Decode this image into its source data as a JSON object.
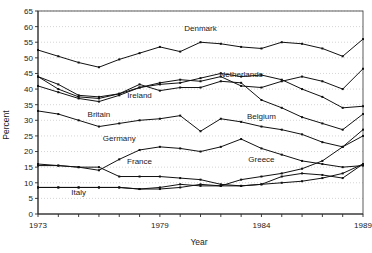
{
  "chart_data": {
    "type": "line",
    "title": "",
    "xlabel": "Year",
    "ylabel": "Percent",
    "xlim": [
      1973,
      1989
    ],
    "ylim": [
      0,
      65
    ],
    "ytick_step": 5,
    "yticks": [
      0,
      5,
      10,
      15,
      20,
      25,
      30,
      35,
      40,
      45,
      50,
      55,
      60,
      65
    ],
    "xticks_labeled": [
      1973,
      1979,
      1984,
      1989
    ],
    "x": [
      1973,
      1974,
      1975,
      1976,
      1977,
      1978,
      1979,
      1980,
      1981,
      1982,
      1983,
      1984,
      1985,
      1986,
      1987,
      1988,
      1989
    ],
    "grid": true,
    "legend_position": "inline-labels",
    "series": [
      {
        "name": "Denmark",
        "label_x": 1981,
        "label_y": 58.5,
        "values": [
          52.5,
          50.5,
          48.5,
          47.0,
          49.5,
          51.5,
          53.5,
          52.0,
          55.0,
          54.5,
          53.5,
          53.0,
          55.0,
          54.5,
          53.0,
          50.5,
          56.0
        ]
      },
      {
        "name": "Netherlands",
        "label_x": 1983,
        "label_y": 44.0,
        "values": [
          44.0,
          41.5,
          38.0,
          37.5,
          38.5,
          40.5,
          42.0,
          43.0,
          42.5,
          44.0,
          41.0,
          40.5,
          42.5,
          44.0,
          42.5,
          40.0,
          46.5
        ]
      },
      {
        "name": "Ireland",
        "label_x": 1978,
        "label_y": 37.0,
        "values": [
          41.0,
          39.0,
          37.0,
          36.0,
          38.0,
          40.5,
          41.5,
          42.0,
          43.5,
          45.0,
          44.0,
          44.5,
          43.0,
          40.0,
          37.5,
          34.0,
          34.5
        ]
      },
      {
        "name": "Britain",
        "label_x": 1976,
        "label_y": 31.0,
        "values": [
          33.0,
          32.0,
          30.0,
          28.0,
          29.0,
          30.0,
          30.5,
          31.5,
          26.5,
          30.5,
          29.5,
          28.0,
          27.0,
          25.5,
          23.0,
          21.5,
          25.0
        ]
      },
      {
        "name": "Belgium",
        "label_x": 1984,
        "label_y": 30.5,
        "values": [
          44.0,
          40.0,
          37.5,
          37.0,
          38.5,
          41.5,
          39.5,
          40.5,
          40.5,
          42.5,
          42.0,
          36.5,
          34.0,
          31.0,
          29.0,
          27.0,
          32.0
        ]
      },
      {
        "name": "Germany",
        "label_x": 1977,
        "label_y": 23.5,
        "values": [
          15.5,
          15.5,
          15.0,
          14.0,
          17.5,
          20.5,
          21.5,
          21.0,
          20.0,
          21.5,
          24.0,
          21.0,
          19.0,
          17.0,
          16.0,
          15.0,
          15.5
        ]
      },
      {
        "name": "France",
        "label_x": 1978,
        "label_y": 16.0,
        "values": [
          16.0,
          15.5,
          15.0,
          15.0,
          12.0,
          12.0,
          12.0,
          11.5,
          11.0,
          9.5,
          9.0,
          9.5,
          12.0,
          13.0,
          12.5,
          11.5,
          16.0
        ]
      },
      {
        "name": "Greece",
        "label_x": 1984,
        "label_y": 16.5,
        "values": [
          8.5,
          8.5,
          8.5,
          8.5,
          8.5,
          8.0,
          8.5,
          9.5,
          9.0,
          9.0,
          11.0,
          12.0,
          13.0,
          14.5,
          17.0,
          21.5,
          27.0
        ]
      },
      {
        "name": "Italy",
        "label_x": 1975,
        "label_y": 6.0,
        "values": [
          8.5,
          8.5,
          8.5,
          8.5,
          8.5,
          8.0,
          8.0,
          8.5,
          9.5,
          9.0,
          9.0,
          9.5,
          10.0,
          10.5,
          11.5,
          13.0,
          16.0
        ]
      }
    ]
  },
  "axis": {
    "ylabel": "Percent",
    "xlabel": "Year"
  }
}
